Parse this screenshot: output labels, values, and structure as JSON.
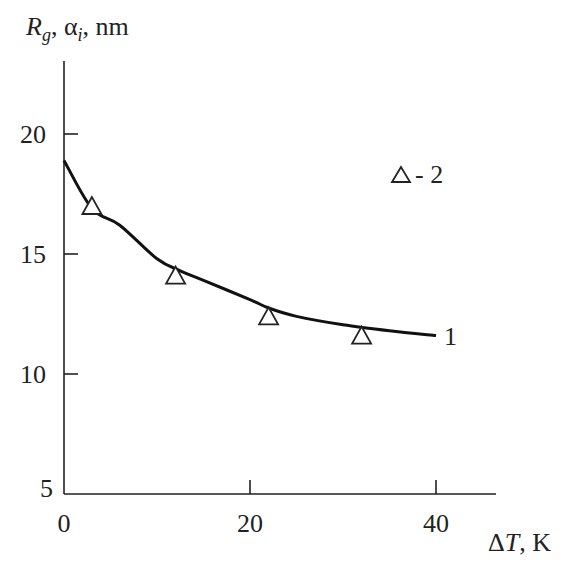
{
  "chart_data": {
    "type": "line",
    "title": "",
    "xlabel": "ΔT, K",
    "ylabel": "R_g, α_i, nm",
    "xlim": [
      0,
      46
    ],
    "ylim": [
      5,
      23
    ],
    "xticks": [
      0,
      20,
      40
    ],
    "yticks": [
      5,
      10,
      15,
      20
    ],
    "grid": false,
    "legend_position": "upper right (inline labels)",
    "series": [
      {
        "name": "1",
        "label": "1",
        "kind": "line",
        "x": [
          0,
          3,
          6,
          10,
          12.5,
          15,
          20,
          22,
          25,
          30,
          35,
          40
        ],
        "y": [
          18.9,
          16.9,
          16.2,
          14.8,
          14.3,
          13.9,
          13.1,
          12.75,
          12.4,
          12.05,
          11.8,
          11.6
        ]
      },
      {
        "name": "2",
        "label": "△ - 2",
        "kind": "scatter",
        "marker": "open-triangle",
        "x": [
          3,
          12,
          22,
          32
        ],
        "y": [
          17.0,
          14.1,
          12.4,
          11.6
        ]
      }
    ]
  },
  "labels": {
    "y_title_main": "R",
    "y_title_sub": "g",
    "y_title_mid": ", α",
    "y_title_sub2": "i",
    "y_title_end": ", nm",
    "x_title_delta": "Δ",
    "x_title_T": "T",
    "x_title_end": ", K",
    "curve_label": "1",
    "legend_entry": "- 2"
  }
}
